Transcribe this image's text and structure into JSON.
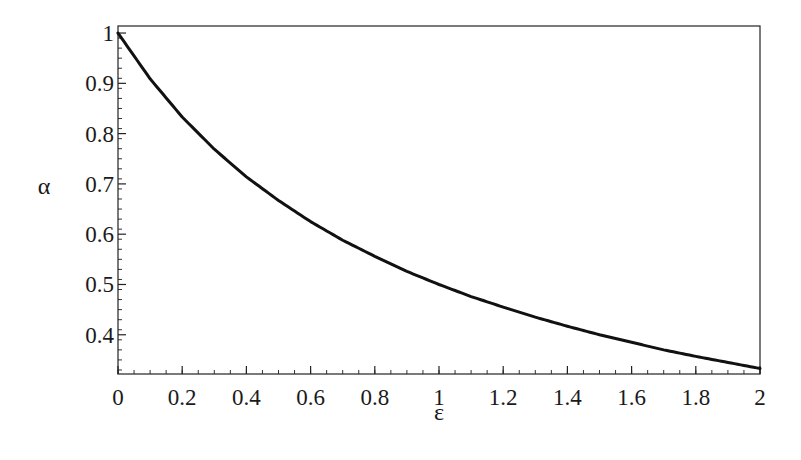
{
  "chart_data": {
    "type": "line",
    "title": "",
    "xlabel": "ε",
    "ylabel": "α",
    "xlim": [
      0,
      2
    ],
    "ylim": [
      0.322,
      1.014
    ],
    "grid": false,
    "legend": null,
    "x_ticks": [
      0,
      0.2,
      0.4,
      0.6,
      0.8,
      1,
      1.2,
      1.4,
      1.6,
      1.8,
      2
    ],
    "x_tick_labels": [
      "0",
      "0.2",
      "0.4",
      "0.6",
      "0.8",
      "1",
      "1.2",
      "1.4",
      "1.6",
      "1.8",
      "2"
    ],
    "y_ticks": [
      0.4,
      0.5,
      0.6,
      0.7,
      0.8,
      0.9,
      1
    ],
    "y_tick_labels": [
      "0.4",
      "0.5",
      "0.6",
      "0.7",
      "0.8",
      "0.9",
      "1"
    ],
    "series": [
      {
        "name": "alpha(epsilon)",
        "color": "#111111",
        "x": [
          0,
          0.1,
          0.2,
          0.3,
          0.4,
          0.5,
          0.6,
          0.7,
          0.8,
          0.9,
          1.0,
          1.1,
          1.2,
          1.3,
          1.4,
          1.5,
          1.6,
          1.7,
          1.8,
          1.9,
          2.0
        ],
        "y": [
          1.0,
          0.909,
          0.833,
          0.769,
          0.714,
          0.667,
          0.625,
          0.588,
          0.556,
          0.526,
          0.5,
          0.476,
          0.455,
          0.435,
          0.417,
          0.4,
          0.385,
          0.37,
          0.357,
          0.345,
          0.333
        ]
      }
    ]
  },
  "plot": {
    "left": 118,
    "right": 760,
    "top": 26,
    "bottom": 374,
    "frame_color": "#222222"
  }
}
